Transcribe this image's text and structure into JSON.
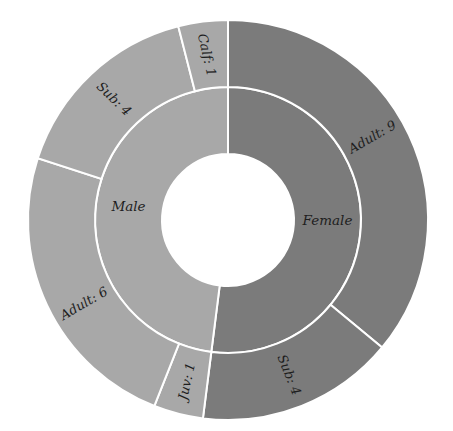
{
  "chart_data": {
    "type": "sunburst",
    "title": "",
    "geometry": {
      "cx": 228,
      "cy": 220,
      "hole_r": 66,
      "inner_r": 133,
      "outer_r": 200,
      "start_angle_deg": 0,
      "direction": "clockwise"
    },
    "colors": {
      "Female": "#7b7b7b",
      "Male": "#a8a8a8",
      "divider": "#ffffff",
      "text": "#1e1e1e"
    },
    "inner": [
      {
        "name": "Female",
        "label": "Female",
        "value": 13
      },
      {
        "name": "Male",
        "label": "Male",
        "value": 12
      }
    ],
    "outer": [
      {
        "parent": "Female",
        "name": "Adult",
        "label": "Adult: 9",
        "value": 9
      },
      {
        "parent": "Female",
        "name": "Sub",
        "label": "Sub: 4",
        "value": 4
      },
      {
        "parent": "Male",
        "name": "Juv",
        "label": "Juv: 1",
        "value": 1
      },
      {
        "parent": "Male",
        "name": "Adult",
        "label": "Adult: 6",
        "value": 6
      },
      {
        "parent": "Male",
        "name": "Sub",
        "label": "Sub: 4",
        "value": 4
      },
      {
        "parent": "Male",
        "name": "Calf",
        "label": "Calf: 1",
        "value": 1
      }
    ],
    "total": 25,
    "legend": "none",
    "grid": false
  }
}
